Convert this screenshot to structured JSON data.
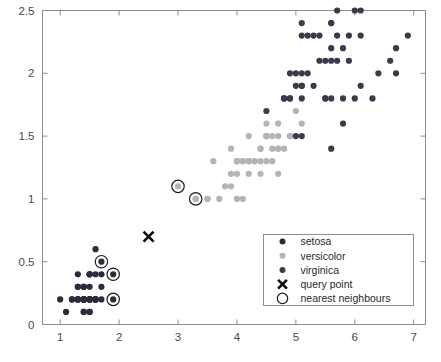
{
  "chart_data": {
    "type": "scatter",
    "title": "",
    "xlabel": "",
    "ylabel": "",
    "xlim": [
      0.7,
      7.2
    ],
    "ylim": [
      0.0,
      2.5
    ],
    "xticks": [
      "1",
      "2",
      "3",
      "4",
      "5",
      "6",
      "7"
    ],
    "xtick_values": [
      1,
      2,
      3,
      4,
      5,
      6,
      7
    ],
    "yticks": [
      "0",
      "0.5",
      "1",
      "1.5",
      "2",
      "2.5"
    ],
    "ytick_values": [
      0,
      0.5,
      1,
      1.5,
      2,
      2.5
    ],
    "grid": false,
    "legend_position": "lower right",
    "series": [
      {
        "name": "setosa",
        "color": "#2b2b3d",
        "marker": "circle",
        "points": [
          [
            1.4,
            0.2
          ],
          [
            1.4,
            0.2
          ],
          [
            1.3,
            0.2
          ],
          [
            1.5,
            0.2
          ],
          [
            1.4,
            0.2
          ],
          [
            1.7,
            0.4
          ],
          [
            1.4,
            0.3
          ],
          [
            1.5,
            0.2
          ],
          [
            1.4,
            0.2
          ],
          [
            1.5,
            0.1
          ],
          [
            1.5,
            0.2
          ],
          [
            1.6,
            0.2
          ],
          [
            1.4,
            0.1
          ],
          [
            1.1,
            0.1
          ],
          [
            1.2,
            0.2
          ],
          [
            1.5,
            0.4
          ],
          [
            1.3,
            0.4
          ],
          [
            1.4,
            0.3
          ],
          [
            1.7,
            0.3
          ],
          [
            1.5,
            0.3
          ],
          [
            1.7,
            0.2
          ],
          [
            1.5,
            0.4
          ],
          [
            1.0,
            0.2
          ],
          [
            1.7,
            0.5
          ],
          [
            1.9,
            0.2
          ],
          [
            1.6,
            0.2
          ],
          [
            1.6,
            0.4
          ],
          [
            1.5,
            0.2
          ],
          [
            1.4,
            0.2
          ],
          [
            1.6,
            0.2
          ],
          [
            1.6,
            0.2
          ],
          [
            1.5,
            0.4
          ],
          [
            1.5,
            0.1
          ],
          [
            1.4,
            0.2
          ],
          [
            1.5,
            0.2
          ],
          [
            1.2,
            0.2
          ],
          [
            1.3,
            0.2
          ],
          [
            1.4,
            0.1
          ],
          [
            1.3,
            0.2
          ],
          [
            1.5,
            0.2
          ],
          [
            1.3,
            0.3
          ],
          [
            1.3,
            0.3
          ],
          [
            1.3,
            0.2
          ],
          [
            1.6,
            0.6
          ],
          [
            1.9,
            0.4
          ],
          [
            1.4,
            0.3
          ],
          [
            1.6,
            0.2
          ],
          [
            1.4,
            0.2
          ],
          [
            1.5,
            0.2
          ],
          [
            1.4,
            0.2
          ]
        ]
      },
      {
        "name": "versicolor",
        "color": "#b4b4b4",
        "marker": "circle",
        "points": [
          [
            4.7,
            1.4
          ],
          [
            4.5,
            1.5
          ],
          [
            4.9,
            1.5
          ],
          [
            4.0,
            1.3
          ],
          [
            4.6,
            1.5
          ],
          [
            4.5,
            1.3
          ],
          [
            4.7,
            1.6
          ],
          [
            3.3,
            1.0
          ],
          [
            4.6,
            1.3
          ],
          [
            3.9,
            1.4
          ],
          [
            3.5,
            1.0
          ],
          [
            4.2,
            1.5
          ],
          [
            4.0,
            1.0
          ],
          [
            4.7,
            1.4
          ],
          [
            3.6,
            1.3
          ],
          [
            4.4,
            1.4
          ],
          [
            4.5,
            1.5
          ],
          [
            4.1,
            1.0
          ],
          [
            4.5,
            1.5
          ],
          [
            3.9,
            1.1
          ],
          [
            4.8,
            1.8
          ],
          [
            4.0,
            1.3
          ],
          [
            4.9,
            1.5
          ],
          [
            4.7,
            1.2
          ],
          [
            4.3,
            1.3
          ],
          [
            4.4,
            1.4
          ],
          [
            4.8,
            1.4
          ],
          [
            5.0,
            1.7
          ],
          [
            4.5,
            1.5
          ],
          [
            3.5,
            1.0
          ],
          [
            3.8,
            1.1
          ],
          [
            3.7,
            1.0
          ],
          [
            3.9,
            1.2
          ],
          [
            5.1,
            1.6
          ],
          [
            4.5,
            1.5
          ],
          [
            4.5,
            1.6
          ],
          [
            4.7,
            1.5
          ],
          [
            4.4,
            1.3
          ],
          [
            4.1,
            1.3
          ],
          [
            4.0,
            1.3
          ],
          [
            4.4,
            1.2
          ],
          [
            4.6,
            1.4
          ],
          [
            4.0,
            1.2
          ],
          [
            3.3,
            1.0
          ],
          [
            4.2,
            1.3
          ],
          [
            4.2,
            1.2
          ],
          [
            4.2,
            1.3
          ],
          [
            4.3,
            1.3
          ],
          [
            3.0,
            1.1
          ],
          [
            4.1,
            1.3
          ]
        ]
      },
      {
        "name": "virginica",
        "color": "#3a3a4c",
        "marker": "circle",
        "points": [
          [
            6.0,
            2.5
          ],
          [
            5.1,
            1.9
          ],
          [
            5.9,
            2.1
          ],
          [
            5.6,
            1.8
          ],
          [
            5.8,
            2.2
          ],
          [
            6.6,
            2.1
          ],
          [
            4.5,
            1.7
          ],
          [
            6.3,
            1.8
          ],
          [
            5.8,
            1.8
          ],
          [
            6.1,
            2.5
          ],
          [
            5.1,
            2.0
          ],
          [
            5.3,
            1.9
          ],
          [
            5.5,
            2.1
          ],
          [
            5.0,
            2.0
          ],
          [
            5.1,
            2.4
          ],
          [
            5.3,
            2.3
          ],
          [
            5.5,
            1.8
          ],
          [
            6.7,
            2.2
          ],
          [
            6.9,
            2.3
          ],
          [
            5.0,
            1.5
          ],
          [
            5.7,
            2.3
          ],
          [
            4.9,
            2.0
          ],
          [
            6.7,
            2.0
          ],
          [
            4.9,
            1.8
          ],
          [
            5.7,
            2.1
          ],
          [
            6.0,
            1.8
          ],
          [
            4.8,
            1.8
          ],
          [
            4.9,
            1.8
          ],
          [
            5.6,
            2.1
          ],
          [
            5.8,
            1.6
          ],
          [
            6.1,
            1.9
          ],
          [
            6.4,
            2.0
          ],
          [
            5.6,
            2.2
          ],
          [
            5.1,
            1.5
          ],
          [
            5.6,
            1.4
          ],
          [
            6.1,
            2.3
          ],
          [
            5.6,
            2.4
          ],
          [
            5.5,
            1.8
          ],
          [
            4.8,
            1.8
          ],
          [
            5.4,
            2.1
          ],
          [
            5.6,
            2.4
          ],
          [
            5.1,
            2.3
          ],
          [
            5.1,
            1.9
          ],
          [
            5.9,
            2.3
          ],
          [
            5.7,
            2.5
          ],
          [
            5.2,
            2.3
          ],
          [
            5.0,
            1.9
          ],
          [
            5.2,
            2.0
          ],
          [
            5.4,
            2.3
          ],
          [
            5.1,
            1.8
          ]
        ]
      }
    ],
    "query_point": {
      "name": "query point",
      "x": 2.5,
      "y": 0.7,
      "color": "#0d0d0d",
      "marker": "x"
    },
    "nearest_neighbours": {
      "name": "nearest neighbours",
      "color": "#1d1d1d",
      "marker": "circle-outline",
      "points": [
        [
          3.0,
          1.1
        ],
        [
          3.3,
          1.0
        ],
        [
          1.7,
          0.5
        ],
        [
          1.9,
          0.4
        ],
        [
          1.9,
          0.2
        ]
      ]
    }
  },
  "legend": {
    "entries": [
      {
        "label": "setosa",
        "marker": "dot",
        "color": "#2b2b3d"
      },
      {
        "label": "versicolor",
        "marker": "dot",
        "color": "#b4b4b4"
      },
      {
        "label": "virginica",
        "marker": "dot",
        "color": "#3a3a4c"
      },
      {
        "label": "query point",
        "marker": "x",
        "color": "#0d0d0d"
      },
      {
        "label": "nearest neighbours",
        "marker": "circle-outline",
        "color": "#1d1d1d"
      }
    ]
  },
  "axes": {
    "x_tick_labels": [
      "1",
      "2",
      "3",
      "4",
      "5",
      "6",
      "7"
    ],
    "y_tick_labels": [
      "0",
      "0.5",
      "1",
      "1.5",
      "2",
      "2.5"
    ]
  },
  "colors": {
    "axis": "#8d8d8d",
    "tick_text": "#4a4a4a",
    "legend_border": "#8d8d8d",
    "background": "#ffffff"
  }
}
